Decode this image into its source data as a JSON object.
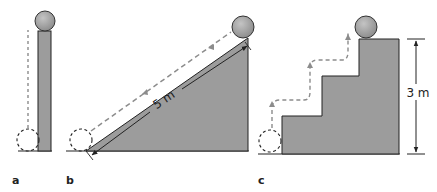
{
  "panels": [
    {
      "id": "a",
      "label": "a",
      "shape": "vertical-column"
    },
    {
      "id": "b",
      "label": "b",
      "shape": "inclined-ramp",
      "dimension_label": "5 m"
    },
    {
      "id": "c",
      "label": "c",
      "shape": "staircase",
      "dimension_label": "3 m"
    }
  ],
  "colors": {
    "solid_fill": "#9c9c9c",
    "outline": "#222222",
    "dashed_path": "#8c8c8c",
    "ball_fill": "#a8a8a8"
  }
}
